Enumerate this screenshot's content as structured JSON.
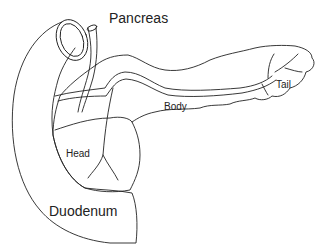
{
  "diagram": {
    "title": "Pancreas",
    "labels": {
      "body": "Body",
      "tail": "Tail",
      "head": "Head",
      "duodenum": "Duodenum"
    },
    "colors": {
      "line": "#222222",
      "background": "#ffffff"
    }
  }
}
